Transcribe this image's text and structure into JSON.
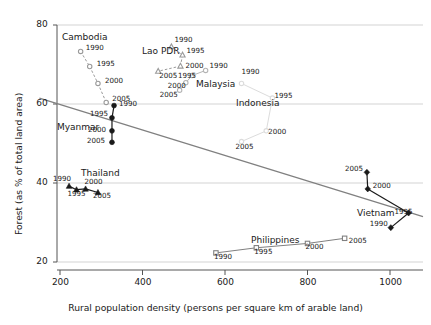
{
  "chart_data": {
    "type": "scatter",
    "title": "",
    "xlabel": "Rural population density (persons per square km of arable land)",
    "ylabel": "Forest (as % of total land area)",
    "xlim": [
      150,
      1080
    ],
    "ylim": [
      18,
      82
    ],
    "xticks": [
      200,
      400,
      600,
      800,
      1000
    ],
    "yticks": [
      20,
      40,
      60,
      80
    ],
    "grid": "horizontal",
    "legend": "inline-series-labels",
    "trendline": {
      "label": "",
      "x0": 150,
      "y0": 61.5,
      "x1": 1080,
      "y1": 31.5,
      "color": "#808080"
    },
    "series": [
      {
        "name": "Cambodia",
        "marker": "circle-open",
        "color": "#9a9a9a",
        "label_pos": {
          "x": 62,
          "y": 32
        },
        "points": [
          {
            "year": "1990",
            "x": 250,
            "y": 73.3,
            "label_dx": 5,
            "label_dy": -4
          },
          {
            "year": "1995",
            "x": 272,
            "y": 69.5,
            "label_dx": 7,
            "label_dy": -3
          },
          {
            "year": "2000",
            "x": 292,
            "y": 65.2,
            "label_dx": 7,
            "label_dy": -3
          },
          {
            "year": "2005",
            "x": 312,
            "y": 60.4,
            "label_dx": 6,
            "label_dy": -4
          }
        ]
      },
      {
        "name": "Lao PDR",
        "marker": "triangle-open",
        "color": "#9a9a9a",
        "label_pos": {
          "x": 142,
          "y": 46
        },
        "points": [
          {
            "year": "1990",
            "x": 470,
            "y": 74.5,
            "label_dx": 3,
            "label_dy": -8
          },
          {
            "year": "1995",
            "x": 497,
            "y": 72.4,
            "label_dx": 4,
            "label_dy": -5
          },
          {
            "year": "2000",
            "x": 492,
            "y": 69.6,
            "label_dx": 5,
            "label_dy": -1
          },
          {
            "year": "2005",
            "x": 438,
            "y": 68.3,
            "label_dx": 1,
            "label_dy": 4
          }
        ]
      },
      {
        "name": "Malaysia",
        "marker": "circle-open",
        "color": "#b4b4b4",
        "label_pos": {
          "x": 196,
          "y": 79
        },
        "points": [
          {
            "year": "1990",
            "x": 553,
            "y": 68.5,
            "label_dx": 4,
            "label_dy": -5
          },
          {
            "year": "1995",
            "x": 520,
            "y": 67.2,
            "label_dx": -14,
            "label_dy": -1
          },
          {
            "year": "2000",
            "x": 505,
            "y": 65.4,
            "label_dx": -18,
            "label_dy": 2
          },
          {
            "year": "2005",
            "x": 490,
            "y": 63.5,
            "label_dx": -20,
            "label_dy": 4
          }
        ]
      },
      {
        "name": "Indonesia",
        "marker": "circle-open",
        "color": "#dcdcdc",
        "label_pos": {
          "x": 236,
          "y": 98
        },
        "points": [
          {
            "year": "1990",
            "x": 640,
            "y": 65.2,
            "label_dx": 0,
            "label_dy": -12
          },
          {
            "year": "1995",
            "x": 715,
            "y": 61.5,
            "label_dx": 2,
            "label_dy": -3
          },
          {
            "year": "2000",
            "x": 700,
            "y": 53.2,
            "label_dx": 2,
            "label_dy": 0
          },
          {
            "year": "2005",
            "x": 640,
            "y": 50.5,
            "label_dx": -6,
            "label_dy": 4
          }
        ]
      },
      {
        "name": "Myanmar",
        "marker": "circle-filled",
        "color": "#1a1a1a",
        "label_pos": {
          "x": 57,
          "y": 122
        },
        "points": [
          {
            "year": "1990",
            "x": 331,
            "y": 59.6,
            "label_dx": 5,
            "label_dy": -3
          },
          {
            "year": "1995",
            "x": 326,
            "y": 56.5,
            "label_dx": -22,
            "label_dy": -5
          },
          {
            "year": "2000",
            "x": 326,
            "y": 53.2,
            "label_dx": -24,
            "label_dy": -2
          },
          {
            "year": "2005",
            "x": 326,
            "y": 50.3,
            "label_dx": -25,
            "label_dy": -2
          }
        ]
      },
      {
        "name": "Thailand",
        "marker": "triangle-filled",
        "color": "#1a1a1a",
        "label_pos": {
          "x": 81,
          "y": 168
        },
        "points": [
          {
            "year": "1990",
            "x": 222,
            "y": 39.2,
            "label_dx": -16,
            "label_dy": -8
          },
          {
            "year": "1995",
            "x": 240,
            "y": 38.3,
            "label_dx": -9,
            "label_dy": 3
          },
          {
            "year": "2000",
            "x": 262,
            "y": 38.5,
            "label_dx": -1,
            "label_dy": -8
          },
          {
            "year": "2005",
            "x": 292,
            "y": 37.6,
            "label_dx": -5,
            "label_dy": 3
          }
        ]
      },
      {
        "name": "Philippines",
        "marker": "square-open",
        "color": "#808080",
        "label_pos": {
          "x": 251,
          "y": 235
        },
        "points": [
          {
            "year": "1990",
            "x": 578,
            "y": 22.3,
            "label_dx": -2,
            "label_dy": 3
          },
          {
            "year": "1995",
            "x": 676,
            "y": 23.6,
            "label_dx": -2,
            "label_dy": 3
          },
          {
            "year": "2000",
            "x": 800,
            "y": 24.7,
            "label_dx": -2,
            "label_dy": 3
          },
          {
            "year": "2005",
            "x": 890,
            "y": 26.0,
            "label_dx": 4,
            "label_dy": 2
          }
        ]
      },
      {
        "name": "Vietnam",
        "marker": "diamond-filled",
        "color": "#1a1a1a",
        "label_pos": {
          "x": 357,
          "y": 208
        },
        "points": [
          {
            "year": "1990",
            "x": 1002,
            "y": 28.7,
            "label_dx": -21,
            "label_dy": -5
          },
          {
            "year": "1995",
            "x": 1045,
            "y": 32.4,
            "label_dx": -14,
            "label_dy": -2
          },
          {
            "year": "2000",
            "x": 946,
            "y": 38.5,
            "label_dx": 5,
            "label_dy": -4
          },
          {
            "year": "2005",
            "x": 944,
            "y": 42.7,
            "label_dx": -22,
            "label_dy": -4
          }
        ]
      }
    ]
  },
  "axes": {
    "x_tick_labels": [
      "200",
      "400",
      "600",
      "800",
      "1000"
    ],
    "y_tick_labels": [
      "20",
      "40",
      "60",
      "80"
    ],
    "x_title": "Rural population density (persons per square km of arable land)",
    "y_title": "Forest (as % of total land area)"
  }
}
